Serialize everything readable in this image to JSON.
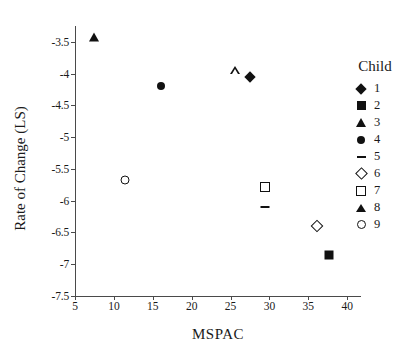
{
  "chart_data": {
    "type": "scatter",
    "title": "",
    "xlabel": "MSPAC",
    "ylabel": "Rate of Change (LS)",
    "xlim": [
      5,
      41
    ],
    "ylim": [
      -7.5,
      -3.25
    ],
    "grid": false,
    "legend_position": "right",
    "legend_title": "Child",
    "xticks": [
      "5",
      "10",
      "15",
      "20",
      "25",
      "30",
      "35",
      "40"
    ],
    "xtick_values": [
      5,
      10,
      15,
      20,
      25,
      30,
      35,
      40
    ],
    "yticks": [
      "-3.5",
      "-4",
      "-4.5",
      "-5",
      "-5.5",
      "-6",
      "-6.5",
      "-7",
      "-7.5"
    ],
    "ytick_values": [
      -3.5,
      -4,
      -4.5,
      -5,
      -5.5,
      -6,
      -6.5,
      -7,
      -7.5
    ],
    "series": [
      {
        "name": "1",
        "marker": "filled-diamond",
        "x": 27.5,
        "y": -4.05
      },
      {
        "name": "2",
        "marker": "filled-square",
        "x": 37.6,
        "y": -6.85
      },
      {
        "name": "3",
        "marker": "filled-triangle",
        "x": 7.5,
        "y": -3.42
      },
      {
        "name": "4",
        "marker": "filled-circle",
        "x": 16.0,
        "y": -4.2
      },
      {
        "name": "5",
        "marker": "dash",
        "x": 29.4,
        "y": -6.1
      },
      {
        "name": "6",
        "marker": "open-diamond",
        "x": 36.1,
        "y": -6.4
      },
      {
        "name": "7",
        "marker": "open-square",
        "x": 29.4,
        "y": -5.78
      },
      {
        "name": "8",
        "marker": "open-triangle",
        "x": 25.6,
        "y": -3.95
      },
      {
        "name": "9",
        "marker": "open-circle",
        "x": 11.4,
        "y": -5.68
      }
    ]
  },
  "legend": {
    "title": "Child",
    "items": [
      {
        "label": "1",
        "marker": "filled-diamond"
      },
      {
        "label": "2",
        "marker": "filled-square"
      },
      {
        "label": "3",
        "marker": "filled-triangle"
      },
      {
        "label": "4",
        "marker": "filled-circle"
      },
      {
        "label": "5",
        "marker": "dash"
      },
      {
        "label": "6",
        "marker": "open-diamond"
      },
      {
        "label": "7",
        "marker": "open-square"
      },
      {
        "label": "8",
        "marker": "open-triangle"
      },
      {
        "label": "9",
        "marker": "open-circle"
      }
    ]
  }
}
